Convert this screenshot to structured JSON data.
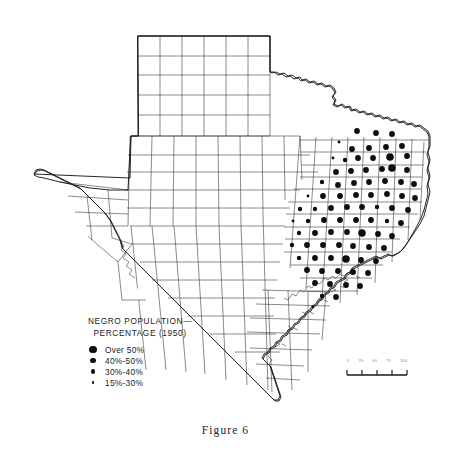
{
  "figure": {
    "caption": "Figure 6"
  },
  "legend": {
    "title_line1": "NEGRO POPULATION—",
    "title_line2": "PERCENTAGE (1950)",
    "items": [
      {
        "label": "Over 50%",
        "dot_px": 7.6,
        "class_name": "over-50"
      },
      {
        "label": "40%-50%",
        "dot_px": 5.8,
        "class_name": "40-50"
      },
      {
        "label": "30%-40%",
        "dot_px": 4.4,
        "class_name": "30-40"
      },
      {
        "label": "15%-30%",
        "dot_px": 2.8,
        "class_name": "15-30"
      }
    ]
  },
  "scale_bar": {
    "labels": [
      "0",
      "25",
      "50",
      "75",
      "100"
    ],
    "unit": "MILES"
  },
  "chart_data": {
    "type": "map",
    "region": "Texas",
    "symbol": "graduated proportional circle per county",
    "classes": [
      {
        "label": "Over 50%",
        "radius_px": 3.8
      },
      {
        "label": "40%-50%",
        "radius_px": 2.9
      },
      {
        "label": "30%-40%",
        "radius_px": 2.2
      },
      {
        "label": "15%-30%",
        "radius_px": 1.4
      }
    ],
    "note": "Dots concentrated in east and northeast Texas; panhandle, west Texas and south Texas have no symbols.",
    "points": [
      {
        "x": 357,
        "y": 131,
        "c": 1
      },
      {
        "x": 376,
        "y": 133,
        "c": 1
      },
      {
        "x": 392,
        "y": 134,
        "c": 1
      },
      {
        "x": 339,
        "y": 142,
        "c": 3
      },
      {
        "x": 352,
        "y": 149,
        "c": 1
      },
      {
        "x": 369,
        "y": 148,
        "c": 1
      },
      {
        "x": 386,
        "y": 147,
        "c": 1
      },
      {
        "x": 402,
        "y": 146,
        "c": 1
      },
      {
        "x": 333,
        "y": 158,
        "c": 3
      },
      {
        "x": 345,
        "y": 160,
        "c": 2
      },
      {
        "x": 358,
        "y": 158,
        "c": 1
      },
      {
        "x": 373,
        "y": 158,
        "c": 1
      },
      {
        "x": 390,
        "y": 157,
        "c": 0
      },
      {
        "x": 407,
        "y": 156,
        "c": 1
      },
      {
        "x": 336,
        "y": 172,
        "c": 1
      },
      {
        "x": 351,
        "y": 171,
        "c": 1
      },
      {
        "x": 366,
        "y": 170,
        "c": 1
      },
      {
        "x": 382,
        "y": 169,
        "c": 1
      },
      {
        "x": 392,
        "y": 168,
        "c": 0
      },
      {
        "x": 407,
        "y": 170,
        "c": 1
      },
      {
        "x": 322,
        "y": 182,
        "c": 2
      },
      {
        "x": 338,
        "y": 185,
        "c": 1
      },
      {
        "x": 354,
        "y": 183,
        "c": 1
      },
      {
        "x": 369,
        "y": 182,
        "c": 1
      },
      {
        "x": 385,
        "y": 181,
        "c": 1
      },
      {
        "x": 401,
        "y": 182,
        "c": 1
      },
      {
        "x": 414,
        "y": 184,
        "c": 1
      },
      {
        "x": 308,
        "y": 196,
        "c": 3
      },
      {
        "x": 323,
        "y": 196,
        "c": 1
      },
      {
        "x": 340,
        "y": 196,
        "c": 1
      },
      {
        "x": 356,
        "y": 195,
        "c": 1
      },
      {
        "x": 371,
        "y": 195,
        "c": 1
      },
      {
        "x": 387,
        "y": 194,
        "c": 1
      },
      {
        "x": 402,
        "y": 196,
        "c": 1
      },
      {
        "x": 415,
        "y": 198,
        "c": 1
      },
      {
        "x": 300,
        "y": 209,
        "c": 2
      },
      {
        "x": 315,
        "y": 209,
        "c": 2
      },
      {
        "x": 331,
        "y": 208,
        "c": 1
      },
      {
        "x": 347,
        "y": 207,
        "c": 1
      },
      {
        "x": 362,
        "y": 207,
        "c": 1
      },
      {
        "x": 377,
        "y": 207,
        "c": 2
      },
      {
        "x": 392,
        "y": 208,
        "c": 1
      },
      {
        "x": 408,
        "y": 210,
        "c": 1
      },
      {
        "x": 293,
        "y": 221,
        "c": 3
      },
      {
        "x": 308,
        "y": 221,
        "c": 2
      },
      {
        "x": 324,
        "y": 220,
        "c": 1
      },
      {
        "x": 340,
        "y": 220,
        "c": 1
      },
      {
        "x": 356,
        "y": 220,
        "c": 1
      },
      {
        "x": 371,
        "y": 220,
        "c": 1
      },
      {
        "x": 387,
        "y": 221,
        "c": 2
      },
      {
        "x": 401,
        "y": 223,
        "c": 1
      },
      {
        "x": 299,
        "y": 233,
        "c": 2
      },
      {
        "x": 315,
        "y": 233,
        "c": 1
      },
      {
        "x": 331,
        "y": 232,
        "c": 1
      },
      {
        "x": 347,
        "y": 232,
        "c": 1
      },
      {
        "x": 362,
        "y": 233,
        "c": 0
      },
      {
        "x": 378,
        "y": 234,
        "c": 1
      },
      {
        "x": 392,
        "y": 236,
        "c": 1
      },
      {
        "x": 292,
        "y": 245,
        "c": 2
      },
      {
        "x": 307,
        "y": 245,
        "c": 1
      },
      {
        "x": 323,
        "y": 245,
        "c": 1
      },
      {
        "x": 339,
        "y": 245,
        "c": 1
      },
      {
        "x": 353,
        "y": 246,
        "c": 1
      },
      {
        "x": 369,
        "y": 247,
        "c": 1
      },
      {
        "x": 384,
        "y": 248,
        "c": 1
      },
      {
        "x": 299,
        "y": 258,
        "c": 2
      },
      {
        "x": 315,
        "y": 258,
        "c": 1
      },
      {
        "x": 331,
        "y": 258,
        "c": 1
      },
      {
        "x": 346,
        "y": 259,
        "c": 0
      },
      {
        "x": 361,
        "y": 260,
        "c": 1
      },
      {
        "x": 376,
        "y": 261,
        "c": 1
      },
      {
        "x": 307,
        "y": 270,
        "c": 1
      },
      {
        "x": 322,
        "y": 271,
        "c": 1
      },
      {
        "x": 338,
        "y": 271,
        "c": 1
      },
      {
        "x": 353,
        "y": 272,
        "c": 1
      },
      {
        "x": 368,
        "y": 273,
        "c": 1
      },
      {
        "x": 315,
        "y": 283,
        "c": 1
      },
      {
        "x": 330,
        "y": 284,
        "c": 1
      },
      {
        "x": 346,
        "y": 285,
        "c": 1
      },
      {
        "x": 360,
        "y": 286,
        "c": 1
      },
      {
        "x": 336,
        "y": 297,
        "c": 1
      },
      {
        "x": 322,
        "y": 296,
        "c": 2
      },
      {
        "x": 313,
        "y": 307,
        "c": 3
      }
    ]
  }
}
